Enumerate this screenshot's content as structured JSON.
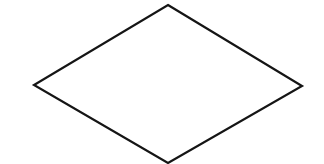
{
  "diagram": {
    "type": "flowchart-shape",
    "background_color": "#ffffff",
    "shapes": [
      {
        "kind": "decision-diamond",
        "label": "",
        "stroke_color": "#151515",
        "fill_color": "#ffffff",
        "stroke_width": 2.2,
        "vertices": {
          "top": [
            168,
            5
          ],
          "right": [
            302,
            86
          ],
          "bottom": [
            168,
            163
          ],
          "left": [
            34,
            85
          ]
        }
      }
    ]
  }
}
